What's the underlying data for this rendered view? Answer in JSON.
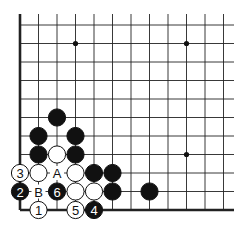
{
  "board": {
    "origin_x": 20,
    "origin_y": 25,
    "spacing": 18.5,
    "cols": 12,
    "rows": 11,
    "right_extent": 234,
    "top_extent": 14,
    "edges": [
      "left",
      "bottom"
    ],
    "star_points": [
      [
        3,
        1
      ],
      [
        9,
        1
      ],
      [
        9,
        7
      ]
    ]
  },
  "stones": [
    {
      "color": "black",
      "c": 2,
      "r": 5,
      "label": ""
    },
    {
      "color": "black",
      "c": 1,
      "r": 6,
      "label": ""
    },
    {
      "color": "black",
      "c": 3,
      "r": 6,
      "label": ""
    },
    {
      "color": "black",
      "c": 1,
      "r": 7,
      "label": ""
    },
    {
      "color": "white",
      "c": 2,
      "r": 7,
      "label": ""
    },
    {
      "color": "black",
      "c": 3,
      "r": 7,
      "label": ""
    },
    {
      "color": "white",
      "c": 0,
      "r": 8,
      "label": "3"
    },
    {
      "color": "white",
      "c": 1,
      "r": 8,
      "label": ""
    },
    {
      "color": "white",
      "c": 3,
      "r": 8,
      "label": ""
    },
    {
      "color": "black",
      "c": 4,
      "r": 8,
      "label": ""
    },
    {
      "color": "black",
      "c": 5,
      "r": 8,
      "label": ""
    },
    {
      "color": "black",
      "c": 0,
      "r": 9,
      "label": "2"
    },
    {
      "color": "black",
      "c": 2,
      "r": 9,
      "label": "6"
    },
    {
      "color": "white",
      "c": 3,
      "r": 9,
      "label": ""
    },
    {
      "color": "white",
      "c": 4,
      "r": 9,
      "label": ""
    },
    {
      "color": "black",
      "c": 5,
      "r": 9,
      "label": ""
    },
    {
      "color": "black",
      "c": 7,
      "r": 9,
      "label": ""
    },
    {
      "color": "white",
      "c": 1,
      "r": 10,
      "label": "1"
    },
    {
      "color": "white",
      "c": 3,
      "r": 10,
      "label": "5"
    },
    {
      "color": "black",
      "c": 4,
      "r": 10,
      "label": "4"
    }
  ],
  "markers": [
    {
      "c": 2,
      "r": 8,
      "label": "A"
    },
    {
      "c": 1,
      "r": 9,
      "label": "B"
    }
  ]
}
